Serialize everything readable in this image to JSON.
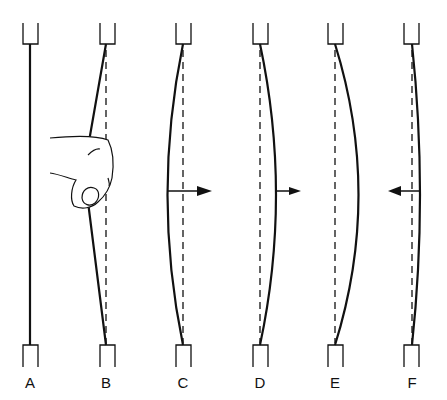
{
  "figure": {
    "colors": {
      "stroke": "#111111",
      "background": "#ffffff"
    },
    "panels": [
      {
        "id": "A",
        "label": "A",
        "x": 30,
        "state": "string at rest"
      },
      {
        "id": "B",
        "label": "B",
        "x": 106,
        "state": "finger pulls string to the left",
        "icon": "finger-icon"
      },
      {
        "id": "C",
        "label": "C",
        "x": 183,
        "state": "string released, moving right",
        "arrow": "right"
      },
      {
        "id": "D",
        "label": "D",
        "x": 260,
        "state": "string passing right of rest",
        "arrow": "right"
      },
      {
        "id": "E",
        "label": "E",
        "x": 335,
        "state": "maximum right displacement"
      },
      {
        "id": "F",
        "label": "F",
        "x": 412,
        "state": "string returning left",
        "arrow": "left"
      }
    ]
  }
}
